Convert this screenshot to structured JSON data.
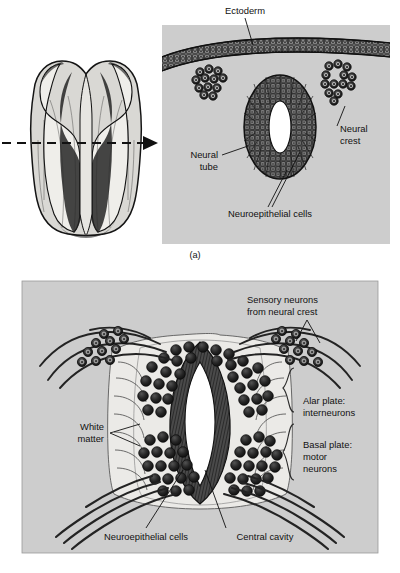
{
  "figure": {
    "panel_letters": [
      "(a)",
      "(b)"
    ],
    "background_color": "#ffffff",
    "panel_fill": "#cdcdcd",
    "tissue_fill": "#e8e8e6",
    "cell_dark": "#2b2b2b",
    "lumen_fill": "#ffffff"
  },
  "panel_a": {
    "letter": "(a)",
    "labels": {
      "ectoderm": "Ectoderm",
      "neural_crest": "Neural\ncrest",
      "neural_crest_line1": "Neural",
      "neural_crest_line2": "crest",
      "neural_tube_line1": "Neural",
      "neural_tube_line2": "tube",
      "neuroepithelial_cells": "Neuroepithelial cells"
    },
    "structures": [
      "ectoderm-epithelium",
      "neural-tube",
      "neural-tube-lumen",
      "neural-crest-cluster-left",
      "neural-crest-cluster-right"
    ],
    "embryo": {
      "stage_description": "neural plate / neural groove stage embryo, dorsal view",
      "section_plane_marker": "dashed-line-with-arrow"
    }
  },
  "panel_b": {
    "letter": "(b)",
    "labels": {
      "sensory_neurons_line1": "Sensory neurons",
      "sensory_neurons_line2": "from neural crest",
      "alar_plate_line1": "Alar plate:",
      "alar_plate_line2": "interneurons",
      "basal_plate_line1": "Basal plate:",
      "basal_plate_line2": "motor",
      "basal_plate_line3": "neurons",
      "white_matter_line1": "White",
      "white_matter_line2": "matter",
      "neuroepithelial_cells": "Neuroepithelial cells",
      "central_cavity": "Central cavity"
    },
    "structures": [
      "spinal-cord-cross-section",
      "central-cavity",
      "neuroepithelial-layer",
      "alar-plate-neurons",
      "basal-plate-neurons",
      "dorsal-root-ganglion-left",
      "dorsal-root-ganglion-right",
      "white-matter-tracts",
      "ventral-root-fibers"
    ]
  }
}
